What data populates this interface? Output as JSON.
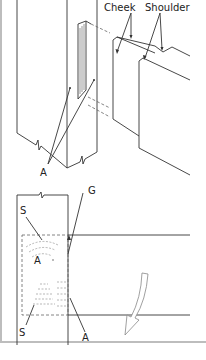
{
  "figure": {
    "type": "technical-illustration",
    "upper_view": {
      "labels": {
        "cheek": "Cheek",
        "shoulder": "Shoulder",
        "a": "A"
      }
    },
    "lower_view": {
      "labels": {
        "s_top": "S",
        "a_top": "A",
        "g": "G",
        "s_bottom": "S",
        "a_bottom": "A"
      },
      "arrow": "curved-down-arrow"
    },
    "colors": {
      "line": "#333333",
      "border": "#bdbdbd",
      "background": "#ffffff"
    }
  }
}
